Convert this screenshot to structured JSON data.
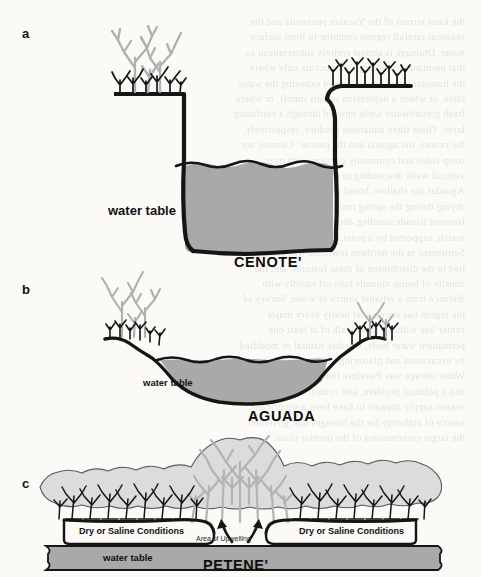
{
  "figure": {
    "title_implicit": "Karst water feature cross-sections",
    "panels": [
      {
        "letter": "a",
        "caption": "CENOTE'",
        "labels": {
          "water_table": "water table"
        },
        "description": "Deep vertical-walled sinkhole filled with water, vegetation on rim",
        "water_level_style": "wavy"
      },
      {
        "letter": "b",
        "caption": "AGUADA",
        "labels": {
          "water_table": "water table"
        },
        "description": "Shallow broad basin with sloping sides holding water",
        "water_level_style": "wavy"
      },
      {
        "letter": "c",
        "caption": "PETENE'",
        "labels": {
          "water_table": "water table",
          "dry_left": "Dry or Saline Conditions",
          "dry_right": "Dry or Saline Conditions",
          "upwelling": "Area of Upwelling"
        },
        "description": "Forest island with central tall tree stand over freshwater upwelling, flanked by low scrub in dry or saline soil",
        "water_level_style": "flat-band"
      }
    ]
  },
  "colors": {
    "water_gray": "#a9a9a9",
    "canopy_gray": "#b7b7b7",
    "land_gray": "#d9d9d9",
    "ink": "#151515",
    "paper": "#fbfaf7"
  },
  "bleed_text": {
    "lines": [
      "the karst terrain of the Yucatan peninsula and the",
      "seasonal rainfall regime combine to limit surface",
      "water. Drainage is almost entirely subterranean so",
      "that permanent standing water occurs only where",
      "the limestone roof has collapsed exposing the water",
      "table, or where a depression retains runoff, or where",
      "fresh groundwater wells upward through a confining",
      "layer. These three situations produce, respectively,",
      "the cenote, the aguada and the petene'. Cenotes are",
      "steep sided and commonly circular, with near",
      "vertical walls descending to the water surface.",
      "Aguadas are shallow, broad and often seasonal,",
      "drying during the spring months. Petenes are",
      "forested islands standing above the surrounding",
      "marsh, supported by a point source of fresh water.",
      "Settlement in the northern lowlands was closely",
      "tied to the distribution of these features, and the",
      "density of house mounds falls off rapidly with",
      "distance from a reliable source of water. Survey of",
      "the region has shown that nearly every major",
      "center lies within a short walk of at least one",
      "permanent water body, whether natural or modified",
      "by excavation and plastering of the catchment.",
      "Water storage was therefore both a technological",
      "and a political problem, and control over the dry",
      "season supply appears to have been a significant",
      "source of authority for the lineages that governed",
      "the larger communities of the interior plain."
    ]
  }
}
